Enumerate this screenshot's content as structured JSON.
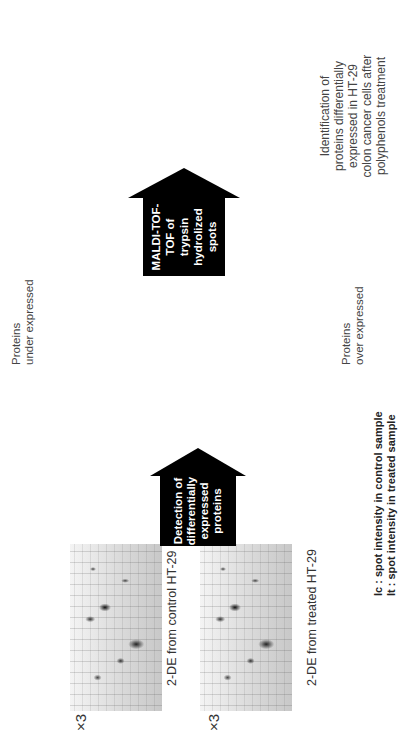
{
  "gels": [
    {
      "caption": "2-DE from control HT-29",
      "magnification": "×3"
    },
    {
      "caption": "2-DE from treated HT-29",
      "magnification": "×3"
    }
  ],
  "arrows": {
    "detection": {
      "lines": [
        "Detection of",
        "differentially",
        "expressed",
        "proteins"
      ]
    },
    "maldi": {
      "lines": [
        "MALDI-TOF-",
        "TOF of trypsin",
        "hydrolized spots"
      ]
    },
    "results": {
      "lines": [
        "MALDI-TOF-TOF",
        "results sent to",
        "Mascot database"
      ]
    }
  },
  "table": {
    "under": {
      "header": {
        "spot": "Spot #",
        "ratio": "Ic/It"
      },
      "rows": [
        {
          "spot": "1604",
          "ratio": "5.37"
        },
        {
          "spot": "8701",
          "ratio": "5.18"
        },
        {
          "spot": "4007",
          "ratio": "3.73"
        },
        {
          "spot": "7003",
          "ratio": "2.88"
        },
        {
          "spot": "2811",
          "ratio": "2.83"
        },
        {
          "spot": "8001",
          "ratio": "2.79"
        },
        {
          "spot": "8303",
          "ratio": "2.69"
        },
        {
          "spot": "5203",
          "ratio": "2.63"
        },
        {
          "spot": "1202",
          "ratio": "2.17"
        },
        {
          "spot": "5302",
          "ratio": "2.03"
        }
      ]
    },
    "over": {
      "header": {
        "spot": "Spot #",
        "ratio": "It/Ic"
      },
      "rows": [
        {
          "spot": "1106",
          "ratio": "4.70"
        },
        {
          "spot": "4102",
          "ratio": "3.87"
        },
        {
          "spot": "1701",
          "ratio": "3.60"
        },
        {
          "spot": "3102",
          "ratio": "2.53"
        },
        {
          "spot": "5307",
          "ratio": "2.50"
        },
        {
          "spot": "6102",
          "ratio": "2.19"
        },
        {
          "spot": "2701",
          "ratio": "2.11"
        }
      ]
    }
  },
  "labels": {
    "under_expressed": [
      "Proteins",
      "under expressed"
    ],
    "over_expressed": [
      "Proteins",
      "over expressed"
    ]
  },
  "legend": {
    "ic": "Ic : spot intensity in control sample",
    "it": "It : spot intensity in treated sample"
  },
  "spectrum": {
    "y_ticks": [
      "0",
      "10",
      "20",
      "30",
      "40",
      "50",
      "60",
      "70",
      "80",
      "90",
      "100"
    ],
    "x_ticks": [
      "899.0",
      "1421.6",
      "1944.2",
      "2466.8",
      "2989.4",
      "3512.0"
    ],
    "x_label": "Mass (m/z)",
    "max_intensity": "3.7E+4"
  },
  "identification": [
    "Identification of",
    "proteins differentially",
    "expressed in HT-29",
    "colon cancer cells after",
    "polyphenols treatment"
  ]
}
